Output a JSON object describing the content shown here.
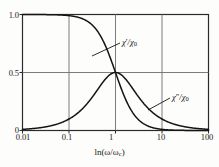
{
  "chart_data": {
    "type": "line",
    "title": "",
    "xlabel": "ln(ω/ωc)",
    "ylabel": "",
    "xscale": "log",
    "xlim": [
      0.01,
      100
    ],
    "ylim": [
      0,
      1.0
    ],
    "grid": true,
    "legend": "inline-annotations",
    "x_ticks": [
      "0.01",
      "0.1",
      "1",
      "10",
      "100"
    ],
    "x_tick_values": [
      0.01,
      0.1,
      1,
      10,
      100
    ],
    "y_ticks": [
      "0",
      "0.5",
      "1.0"
    ],
    "y_tick_values": [
      0,
      0.5,
      1.0
    ],
    "series": [
      {
        "name": "χ'/χ0",
        "label_html": "<i>χ</i><span class=\"prime\">′</span>/<i>χ</i><span class=\"sub\">0</span>",
        "description": "real part of susceptibility, descending sigmoid 1/(1+(w/wc)^2) normalized to cross 0.5 at w=wc",
        "x": [
          0.01,
          0.02,
          0.05,
          0.1,
          0.2,
          0.3,
          0.5,
          0.7,
          1.0,
          1.5,
          2.0,
          3.0,
          5.0,
          10.0,
          20.0,
          50.0,
          100.0
        ],
        "y": [
          1.0,
          0.999,
          0.997,
          0.99,
          0.962,
          0.917,
          0.8,
          0.671,
          0.5,
          0.308,
          0.2,
          0.1,
          0.038,
          0.0099,
          0.0025,
          0.0004,
          0.0001
        ]
      },
      {
        "name": "χ''/χ0",
        "label_html": "<i>χ</i><span class=\"prime\">″</span>/<i>χ</i><span class=\"sub\">0</span>",
        "description": "imaginary part of susceptibility, symmetric peak on log axis, maximum 0.5 at w=wc",
        "x": [
          0.01,
          0.02,
          0.05,
          0.1,
          0.2,
          0.3,
          0.5,
          0.7,
          1.0,
          1.5,
          2.0,
          3.0,
          5.0,
          10.0,
          20.0,
          50.0,
          100.0
        ],
        "y": [
          0.01,
          0.02,
          0.05,
          0.099,
          0.192,
          0.275,
          0.4,
          0.47,
          0.5,
          0.462,
          0.4,
          0.3,
          0.192,
          0.099,
          0.05,
          0.02,
          0.01
        ]
      }
    ],
    "annotations": [
      {
        "name": "chi-prime-label",
        "text": "χ′/χ0",
        "leader_from": [
          120,
          43
        ],
        "leader_to": [
          92,
          56
        ]
      },
      {
        "name": "chi-double-prime-label",
        "text": "χ″/χ0",
        "leader_from": [
          170,
          98
        ],
        "leader_to": [
          148,
          110
        ]
      }
    ]
  },
  "axes": {
    "x_title": "ln(ω/ω",
    "x_title_sub": "c",
    "x_title_close": ")",
    "x_tick_labels": [
      "0.01",
      "0.1",
      "1",
      "10",
      "100"
    ],
    "y_tick_labels": [
      "1.0",
      "0.5",
      "0"
    ]
  },
  "colors": {
    "curve": "#141414",
    "grid": "#6e6e6e",
    "axis": "#2b2b2b",
    "background": "#fdfdfc",
    "text": "#1a1a1a"
  }
}
